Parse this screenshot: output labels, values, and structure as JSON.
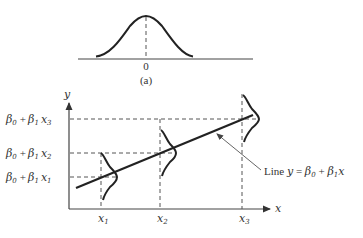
{
  "panel_a": {
    "zero_label": "0",
    "caption": "(a)"
  },
  "panel_b": {
    "y_axis_label": "y",
    "x_axis_label": "x",
    "levels": [
      {
        "beta0": "β",
        "sub0": "0",
        "plus": "+",
        "beta1": "β",
        "sub1": "1",
        "xvar": "x",
        "subx": "3"
      },
      {
        "beta0": "β",
        "sub0": "0",
        "plus": "+",
        "beta1": "β",
        "sub1": "1",
        "xvar": "x",
        "subx": "2"
      },
      {
        "beta0": "β",
        "sub0": "0",
        "plus": "+",
        "beta1": "β",
        "sub1": "1",
        "xvar": "x",
        "subx": "1"
      }
    ],
    "x_ticks": [
      {
        "var": "x",
        "sub": "1"
      },
      {
        "var": "x",
        "sub": "2"
      },
      {
        "var": "x",
        "sub": "3"
      }
    ],
    "line_label": {
      "prefix": "Line ",
      "y": "y",
      "eq": " = ",
      "b0": "β",
      "b0sub": "0",
      "plus": " + ",
      "b1": "β",
      "b1sub": "1",
      "x": "x"
    }
  }
}
